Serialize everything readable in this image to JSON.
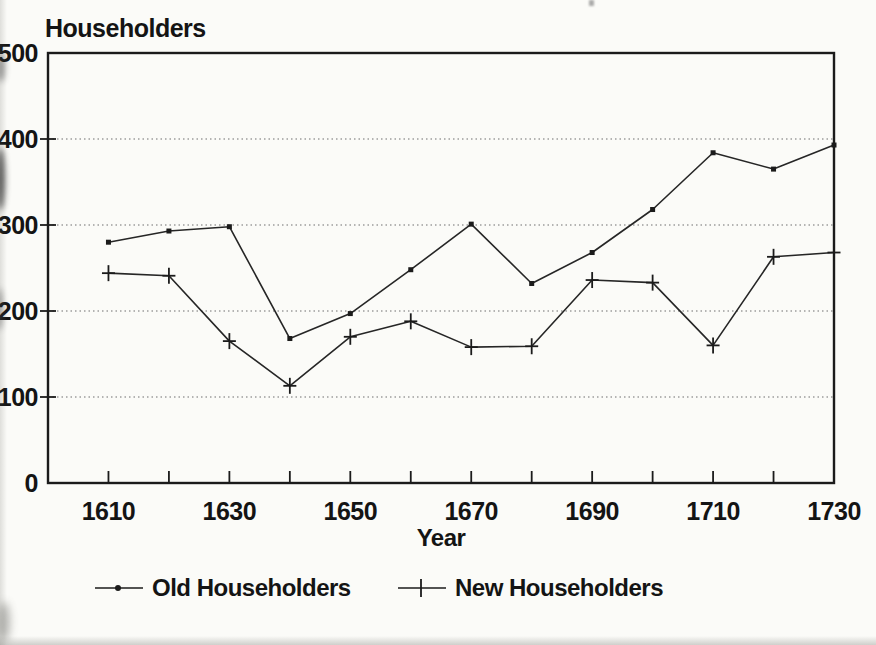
{
  "page": {
    "background": "#fbfbf8"
  },
  "colors": {
    "line": "#262626",
    "grid": "#6e6e6e",
    "text": "#141414",
    "frame": "#1b1b1b",
    "background": "#fbfbf8"
  },
  "chart_data": {
    "type": "line",
    "title": "",
    "ylabel": "Householders",
    "xlabel": "Year",
    "xlim": [
      1600,
      1730
    ],
    "ylim": [
      0,
      500
    ],
    "y_ticks": [
      0,
      100,
      200,
      300,
      400,
      500
    ],
    "y_tick_labels_visible": [
      "0",
      "00",
      "00",
      "00",
      "00",
      "00"
    ],
    "x": [
      1610,
      1620,
      1630,
      1640,
      1650,
      1660,
      1670,
      1680,
      1690,
      1700,
      1710,
      1720,
      1730
    ],
    "x_labeled_ticks": [
      1610,
      1630,
      1650,
      1670,
      1690,
      1710,
      1730
    ],
    "grid": "horizontal-dotted",
    "legend_position": "bottom",
    "series": [
      {
        "name": "Old Householders",
        "marker": "square",
        "values": [
          280,
          293,
          298,
          168,
          197,
          248,
          301,
          232,
          268,
          318,
          384,
          365,
          393
        ]
      },
      {
        "name": "New Householders",
        "marker": "plus",
        "values": [
          244,
          241,
          165,
          113,
          170,
          188,
          158,
          159,
          236,
          233,
          160,
          263,
          268
        ]
      }
    ]
  }
}
